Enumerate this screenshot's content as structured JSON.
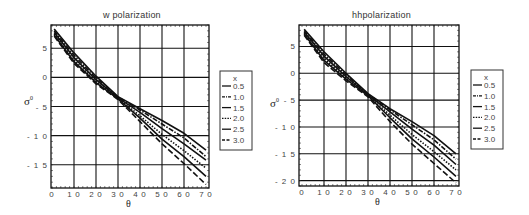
{
  "chart_data": [
    {
      "type": "line",
      "title": "w polarization",
      "xlabel": "θ",
      "ylabel": "σ0",
      "xlim": [
        0,
        70
      ],
      "ylim": [
        -19,
        9
      ],
      "xticks": [
        0,
        10,
        20,
        30,
        40,
        50,
        60,
        70
      ],
      "yticks": [
        5,
        0,
        -5,
        -10,
        -15
      ],
      "ytick_labels": [
        "5",
        "0",
        "- 5",
        "- 1 0",
        "- 1 5"
      ],
      "grid": true,
      "legend_title": "x",
      "legend_position": "right",
      "x": [
        1,
        10,
        20,
        30,
        40,
        50,
        60,
        70
      ],
      "series": [
        {
          "name": "0.5",
          "style": "solid",
          "values": [
            8.3,
            4.2,
            0.2,
            -3.3,
            -5.4,
            -7.4,
            -9.6,
            -12.5
          ]
        },
        {
          "name": "1.0",
          "style": "dashdot",
          "values": [
            8.0,
            3.8,
            -0.1,
            -3.4,
            -5.6,
            -8.0,
            -10.4,
            -13.6
          ]
        },
        {
          "name": "1.5",
          "style": "solid",
          "values": [
            7.7,
            3.4,
            -0.4,
            -3.5,
            -6.0,
            -8.8,
            -11.4,
            -14.2
          ]
        },
        {
          "name": "2.0",
          "style": "dotted",
          "values": [
            7.5,
            3.0,
            -0.7,
            -3.6,
            -6.6,
            -9.8,
            -12.6,
            -15.6
          ]
        },
        {
          "name": "2.5",
          "style": "solid",
          "values": [
            7.3,
            2.7,
            -0.9,
            -3.7,
            -7.0,
            -10.6,
            -13.6,
            -17.0
          ]
        },
        {
          "name": "3.0",
          "style": "longdash",
          "values": [
            7.1,
            2.4,
            -1.1,
            -3.8,
            -7.6,
            -11.4,
            -14.8,
            -18.4
          ]
        }
      ]
    },
    {
      "type": "line",
      "title": "hhpolarization",
      "xlabel": "θ",
      "ylabel": "σ0",
      "xlim": [
        0,
        70
      ],
      "ylim": [
        -21,
        9
      ],
      "xticks": [
        0,
        10,
        20,
        30,
        40,
        50,
        60,
        70
      ],
      "yticks": [
        5,
        0,
        -5,
        -10,
        -15,
        -20
      ],
      "ytick_labels": [
        "5",
        "0",
        "- 5",
        "- 1 0",
        "- 1 5",
        "- 2 0"
      ],
      "grid": true,
      "legend_title": "x",
      "legend_position": "right",
      "x": [
        1,
        10,
        20,
        30,
        40,
        50,
        60,
        70
      ],
      "series": [
        {
          "name": "0.5",
          "style": "solid",
          "values": [
            8.2,
            4.0,
            0.0,
            -3.8,
            -6.6,
            -9.0,
            -11.6,
            -15.0
          ]
        },
        {
          "name": "1.0",
          "style": "dashdot",
          "values": [
            8.0,
            3.6,
            -0.3,
            -3.9,
            -6.8,
            -9.6,
            -12.4,
            -16.0
          ]
        },
        {
          "name": "1.5",
          "style": "solid",
          "values": [
            7.7,
            3.2,
            -0.6,
            -4.0,
            -7.2,
            -10.4,
            -13.4,
            -17.0
          ]
        },
        {
          "name": "2.0",
          "style": "dotted",
          "values": [
            7.5,
            2.8,
            -0.9,
            -4.1,
            -7.8,
            -11.4,
            -14.6,
            -18.0
          ]
        },
        {
          "name": "2.5",
          "style": "solid",
          "values": [
            7.3,
            2.4,
            -1.1,
            -4.2,
            -8.3,
            -12.2,
            -15.6,
            -19.2
          ]
        },
        {
          "name": "3.0",
          "style": "longdash",
          "values": [
            7.1,
            2.0,
            -1.4,
            -4.4,
            -9.0,
            -13.2,
            -16.8,
            -20.4
          ]
        }
      ]
    }
  ],
  "layout": [
    {
      "frame": {
        "x": 51,
        "y": 25,
        "w": 158,
        "h": 163
      },
      "x0px": 52,
      "x70px": 206,
      "legend": {
        "x": 220,
        "y": 71,
        "w": 32,
        "h": 79
      },
      "title_pos": {
        "x": 103,
        "y": 10
      },
      "ylabel_pos": {
        "x": 24,
        "y": 95
      },
      "xlabel_pos": {
        "x": 126,
        "y": 199
      }
    },
    {
      "frame": {
        "x": 299,
        "y": 25,
        "w": 160,
        "h": 161
      },
      "x0px": 302,
      "x70px": 456,
      "legend": {
        "x": 471,
        "y": 70,
        "w": 32,
        "h": 79
      },
      "title_pos": {
        "x": 352,
        "y": 10
      },
      "ylabel_pos": {
        "x": 270,
        "y": 97
      },
      "xlabel_pos": {
        "x": 375,
        "y": 197
      }
    }
  ]
}
